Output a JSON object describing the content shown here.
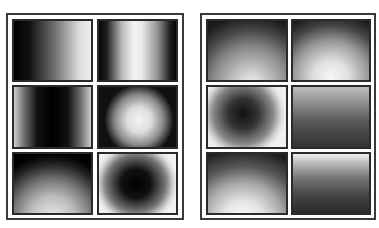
{
  "figure": {
    "panels": [
      {
        "id": "left",
        "tiles": [
          {
            "pattern": "horizontal-ramp-dark-to-light"
          },
          {
            "pattern": "vertical-bright-band-center"
          },
          {
            "pattern": "vertical-dark-band-center"
          },
          {
            "pattern": "radial-bright-center"
          },
          {
            "pattern": "radial-bright-bottom"
          },
          {
            "pattern": "radial-dark-center"
          }
        ]
      },
      {
        "id": "right",
        "tiles": [
          {
            "pattern": "bottom-glow-dark-top"
          },
          {
            "pattern": "bottom-glow-dark-top-strong"
          },
          {
            "pattern": "radial-dark-center-soft"
          },
          {
            "pattern": "vertical-ramp-light-top"
          },
          {
            "pattern": "bottom-glow-bright"
          },
          {
            "pattern": "vertical-ramp-bright-top-edge"
          }
        ]
      }
    ],
    "colors": {
      "frame": "#3a3a3a",
      "tile_border": "#2a2a2a",
      "background": "#ffffff"
    }
  }
}
